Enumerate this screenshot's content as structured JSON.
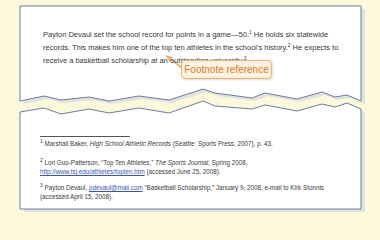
{
  "colors": {
    "background": "#fcf8dc",
    "page": "#ffffff",
    "page_border": "#5a6f98",
    "callout_border": "#f0b47a",
    "callout_text": "#e07b2a",
    "link": "#3a55b0"
  },
  "body": {
    "seg1": "Payton Devaul set the school record for points in a game—50.",
    "ref1": "1",
    "seg2": "  He holds six statewide records.  This makes him one of the top ten athletes in the school’s history.",
    "ref2": "2",
    "seg3": "  He expects to receive a basketball scholarship at an outstanding university.",
    "ref3": "3"
  },
  "callout": {
    "label": "Footnote reference"
  },
  "footnotes": [
    {
      "num": "1",
      "author": "Marshall Baker, ",
      "title": "High School Athletic Records",
      "rest": " (Seattle:  Sports Press, 2007), p. 43."
    },
    {
      "num": "2",
      "author": "Lori Guo-Patterson, “Top Ten Athletes,” ",
      "title": "The Sports Journal",
      "mid": ", Spring 2008, ",
      "link": "http://www.tsj.edu/athletes/topten.htm",
      "rest": " (accessed June 25, 2008)."
    },
    {
      "num": "3",
      "author": "Payton Devaul, ",
      "link": "pdevaul@mail.com",
      "rest": " “Basketball Scholarship,” January 9, 2008, e-mail to Kirk Stonnis (accessed April 15, 2008)."
    }
  ]
}
